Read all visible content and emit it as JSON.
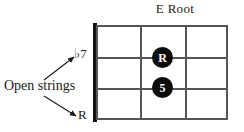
{
  "diagram": {
    "title": "E Root",
    "type": "bass-fretboard-chord-diagram",
    "instrument_strings": 4,
    "frets_shown": 3,
    "nut_shown": true
  },
  "annotations": {
    "open_strings_label": "Open strings",
    "interval_top": "♭7",
    "interval_bottom": "R",
    "arrow_up_name": "arrow-to-flat-seven",
    "arrow_down_name": "arrow-to-root"
  },
  "markers": [
    {
      "label": "R",
      "string_index": 1,
      "fret": 2,
      "name": "root-dot"
    },
    {
      "label": "5",
      "string_index": 2,
      "fret": 2,
      "name": "fifth-dot"
    }
  ],
  "colors": {
    "ink": "#1a1a1a",
    "grid": "#555555",
    "nut": "#111111",
    "dot_fill": "#0c0c0c",
    "dot_text": "#ffffff",
    "background": "#ffffff"
  }
}
